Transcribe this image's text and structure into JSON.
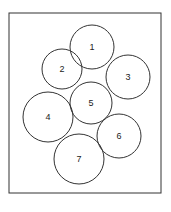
{
  "diagram": {
    "frame": {
      "x": 9,
      "y": 13,
      "width": 152,
      "height": 180,
      "stroke": "#333333"
    },
    "circles": [
      {
        "label": "1",
        "cx": 92,
        "cy": 47,
        "r": 22
      },
      {
        "label": "2",
        "cx": 62,
        "cy": 69,
        "r": 20
      },
      {
        "label": "3",
        "cx": 128,
        "cy": 77,
        "r": 22
      },
      {
        "label": "4",
        "cx": 48,
        "cy": 117,
        "r": 25
      },
      {
        "label": "5",
        "cx": 91,
        "cy": 103,
        "r": 21
      },
      {
        "label": "6",
        "cx": 119,
        "cy": 136,
        "r": 22
      },
      {
        "label": "7",
        "cx": 79,
        "cy": 159,
        "r": 25
      }
    ]
  }
}
